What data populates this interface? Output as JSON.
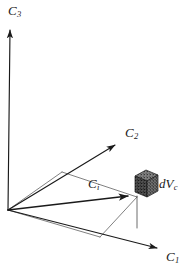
{
  "figure": {
    "type": "3d-coordinate-diagram",
    "background_color": "#ffffff",
    "stroke_color": "#1a1a1a",
    "labels": {
      "axis_c3": {
        "base": "C",
        "sub": "3"
      },
      "axis_c2": {
        "base": "C",
        "sub": "2"
      },
      "axis_c1": {
        "base": "C",
        "sub": "1"
      },
      "vector_ci": {
        "base": "C",
        "sub": "i"
      },
      "volume_element": {
        "base": "dV",
        "sub": "c"
      }
    },
    "geometry": {
      "origin": [
        8,
        210
      ],
      "axis_c3_tip": [
        10,
        26
      ],
      "axis_c2_tip": [
        122,
        140
      ],
      "axis_c1_tip": [
        165,
        252
      ],
      "vector_ci_tip": [
        136,
        197
      ],
      "cube_center": [
        146,
        185
      ],
      "cube_size": 22,
      "projection_vertices": [
        [
          8,
          210
        ],
        [
          62,
          172
        ],
        [
          137,
          197
        ],
        [
          100,
          237
        ]
      ],
      "drop_line": [
        [
          137,
          197
        ],
        [
          137,
          228
        ]
      ]
    },
    "elements": {
      "axis_c3_name": "vertical-axis",
      "axis_c2_name": "depth-axis",
      "axis_c1_name": "horizontal-axis",
      "vector_name": "position-vector",
      "cube_name": "volume-element-cube",
      "projection_name": "projection-parallelogram"
    }
  }
}
